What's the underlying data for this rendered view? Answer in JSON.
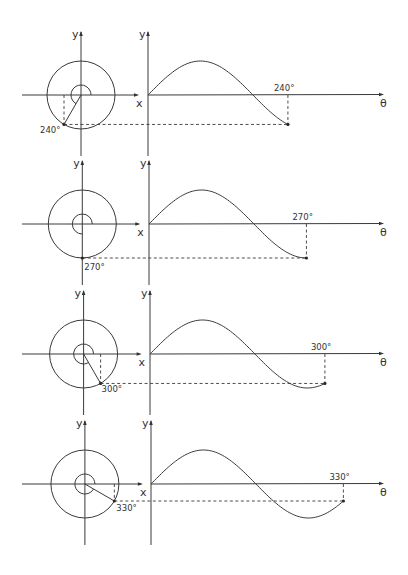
{
  "figure": {
    "axis_labels": {
      "y": "y",
      "x": "x",
      "theta": "θ"
    },
    "panels": [
      {
        "angle_deg": 240,
        "angle_label": "240°",
        "origin_y": 95
      },
      {
        "angle_deg": 270,
        "angle_label": "270°",
        "origin_y": 224
      },
      {
        "angle_deg": 300,
        "angle_label": "300°",
        "origin_y": 354
      },
      {
        "angle_deg": 330,
        "angle_label": "330°",
        "origin_y": 484
      }
    ]
  },
  "chart_data": {
    "type": "line",
    "title": "",
    "xlabel": "θ",
    "ylabel": "y",
    "x_range_deg": [
      0,
      360
    ],
    "function": "y = sin(θ)",
    "series": [
      {
        "name": "240°",
        "end_angle": 240,
        "end_value": -0.866
      },
      {
        "name": "270°",
        "end_angle": 270,
        "end_value": -1.0
      },
      {
        "name": "300°",
        "end_angle": 300,
        "end_value": -0.866
      },
      {
        "name": "330°",
        "end_angle": 330,
        "end_value": -0.5
      }
    ]
  }
}
